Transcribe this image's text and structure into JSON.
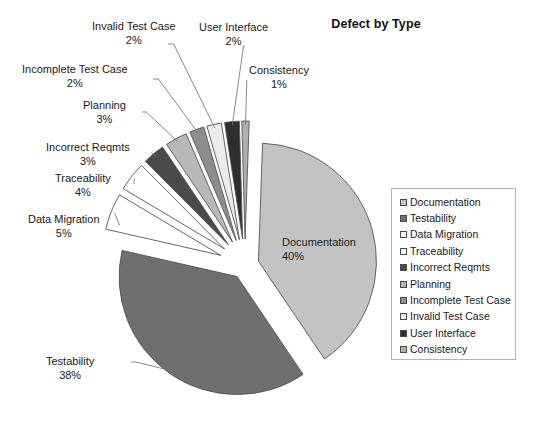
{
  "chart": {
    "title": "Defect by Type"
  },
  "chart_data": {
    "type": "pie",
    "title": "Defect by Type",
    "xlabel": "",
    "ylabel": "",
    "legend_position": "right",
    "grid": false,
    "exploded": true,
    "value_unit": "%",
    "categories": [
      "Documentation",
      "Testability",
      "Data Migration",
      "Traceability",
      "Incorrect Reqmts",
      "Planning",
      "Incomplete Test Case",
      "Invalid Test Case",
      "User Interface",
      "Consistency"
    ],
    "values": [
      40,
      38,
      5,
      4,
      3,
      3,
      2,
      2,
      2,
      1
    ],
    "labels": [
      "40%",
      "38%",
      "5%",
      "4%",
      "3%",
      "3%",
      "2%",
      "2%",
      "2%",
      "1%"
    ],
    "colors": [
      "#c3c3c3",
      "#6f6f6f",
      "#ffffff",
      "#ffffff",
      "#4a4a4a",
      "#b8b8b8",
      "#8e8e8e",
      "#ececec",
      "#2e2e2e",
      "#b0b0b0"
    ],
    "slices": [
      {
        "name": "Documentation",
        "value": 40,
        "label": "40%",
        "color": "#c3c3c3"
      },
      {
        "name": "Testability",
        "value": 38,
        "label": "38%",
        "color": "#6f6f6f"
      },
      {
        "name": "Data Migration",
        "value": 5,
        "label": "5%",
        "color": "#ffffff"
      },
      {
        "name": "Traceability",
        "value": 4,
        "label": "4%",
        "color": "#ffffff"
      },
      {
        "name": "Incorrect Reqmts",
        "value": 3,
        "label": "3%",
        "color": "#4a4a4a"
      },
      {
        "name": "Planning",
        "value": 3,
        "label": "3%",
        "color": "#b8b8b8"
      },
      {
        "name": "Incomplete Test Case",
        "value": 2,
        "label": "2%",
        "color": "#8e8e8e"
      },
      {
        "name": "Invalid Test Case",
        "value": 2,
        "label": "2%",
        "color": "#ececec"
      },
      {
        "name": "User Interface",
        "value": 2,
        "label": "2%",
        "color": "#2e2e2e"
      },
      {
        "name": "Consistency",
        "value": 1,
        "label": "1%",
        "color": "#b0b0b0"
      }
    ]
  },
  "callouts": {
    "documentation": {
      "name": "Documentation",
      "pct": "40%"
    },
    "testability": {
      "name": "Testability",
      "pct": "38%"
    },
    "data_migration": {
      "name": "Data Migration",
      "pct": "5%"
    },
    "traceability": {
      "name": "Traceability",
      "pct": "4%"
    },
    "incorrect_reqmts": {
      "name": "Incorrect Reqmts",
      "pct": "3%"
    },
    "planning": {
      "name": "Planning",
      "pct": "3%"
    },
    "incomplete_test_case": {
      "name": "Incomplete Test Case",
      "pct": "2%"
    },
    "invalid_test_case": {
      "name": "Invalid Test Case",
      "pct": "2%"
    },
    "user_interface": {
      "name": "User Interface",
      "pct": "2%"
    },
    "consistency": {
      "name": "Consistency",
      "pct": "1%"
    }
  },
  "legend": {
    "items": [
      {
        "label": "Documentation",
        "color": "#c3c3c3"
      },
      {
        "label": "Testability",
        "color": "#6f6f6f"
      },
      {
        "label": "Data Migration",
        "color": "#ffffff"
      },
      {
        "label": "Traceability",
        "color": "#ffffff"
      },
      {
        "label": "Incorrect Reqmts",
        "color": "#4a4a4a"
      },
      {
        "label": "Planning",
        "color": "#b8b8b8"
      },
      {
        "label": "Incomplete Test Case",
        "color": "#8e8e8e"
      },
      {
        "label": "Invalid Test Case",
        "color": "#ececec"
      },
      {
        "label": "User Interface",
        "color": "#2e2e2e"
      },
      {
        "label": "Consistency",
        "color": "#b0b0b0"
      }
    ]
  }
}
